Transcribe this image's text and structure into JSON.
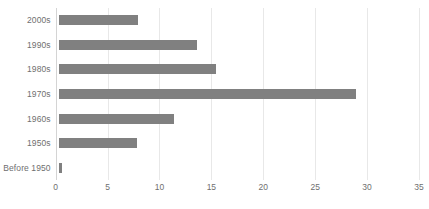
{
  "chart_data": {
    "type": "bar",
    "orientation": "horizontal",
    "title": "",
    "subtitle": "",
    "xlabel": "",
    "ylabel": "",
    "categories": [
      "Before 1950",
      "1950s",
      "1960s",
      "1970s",
      "1980s",
      "1990s",
      "2000s"
    ],
    "values": [
      0.6,
      7.8,
      11.4,
      28.9,
      15.4,
      13.6,
      7.9
    ],
    "display_order_top_to_bottom": [
      "2000s",
      "1990s",
      "1980s",
      "1970s",
      "1960s",
      "1950s",
      "Before 1950"
    ],
    "xlim": [
      0,
      35
    ],
    "xticks": [
      0,
      5,
      10,
      15,
      20,
      25,
      30,
      35
    ],
    "xtick_labels": [
      "0",
      "5",
      "10",
      "15",
      "20",
      "25",
      "30",
      "35"
    ],
    "grid": "vertical",
    "legend": "none",
    "series": [
      {
        "name": "",
        "values": [
          0.6,
          7.8,
          11.4,
          28.9,
          15.4,
          13.6,
          7.9
        ]
      }
    ],
    "colors": {
      "bar": "#808080",
      "gridline": "#e8e8e8",
      "axis": "#d4d4d4",
      "text": "#6f6f6f",
      "background": "#ffffff"
    }
  }
}
